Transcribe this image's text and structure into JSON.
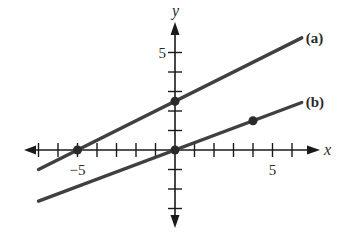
{
  "chart_data": {
    "type": "line",
    "title": "",
    "xlabel": "x",
    "ylabel": "y",
    "xlim": [
      -7.5,
      8.5
    ],
    "ylim": [
      -4.5,
      6.5
    ],
    "grid": false,
    "x_tick_labels": [
      {
        "value": -5,
        "label": "-5"
      },
      {
        "value": 5,
        "label": "5"
      }
    ],
    "y_tick_labels": [
      {
        "value": 5,
        "label": "5"
      }
    ],
    "x_ticks": [
      -7,
      -6,
      -5,
      -4,
      -3,
      -2,
      -1,
      1,
      2,
      3,
      4,
      5,
      6
    ],
    "y_ticks": [
      -3,
      -2,
      -1,
      1,
      2,
      3,
      4,
      5
    ],
    "series": [
      {
        "name": "(a)",
        "equation": "y = x/2 + 5/2",
        "x": [
          -7,
          6.5
        ],
        "y": [
          -1,
          5.75
        ],
        "marked_points": [
          [
            -5,
            0
          ],
          [
            0,
            2.5
          ]
        ]
      },
      {
        "name": "(b)",
        "equation": "y = 3x/8",
        "x": [
          -7,
          6.5
        ],
        "y": [
          -2.625,
          2.4375
        ],
        "marked_points": [
          [
            0,
            0
          ],
          [
            4,
            1.5
          ]
        ]
      }
    ],
    "legend_position": "right end of each line",
    "colors": {
      "axis": "#1a1a1a",
      "line": "#404040",
      "point": "#2a2a2a"
    }
  }
}
